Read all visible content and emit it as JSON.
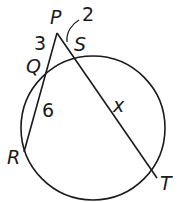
{
  "diagram": {
    "type": "circle-secant-theorem",
    "circle": {
      "cx": 93,
      "cy": 128,
      "r": 72
    },
    "points": {
      "P": {
        "label": "P",
        "x": 57,
        "y": 33
      },
      "Q": {
        "label": "Q",
        "x": 46,
        "y": 71
      },
      "S": {
        "label": "S",
        "x": 72,
        "y": 56
      },
      "R": {
        "label": "R",
        "x": 24,
        "y": 152
      },
      "T": {
        "label": "T",
        "x": 157,
        "y": 178
      }
    },
    "segments": [
      {
        "from": "P",
        "to": "R"
      },
      {
        "from": "P",
        "to": "T"
      }
    ],
    "measures": {
      "PQ": "3",
      "QR": "6",
      "PS": "2",
      "ST": "x"
    },
    "stroke_color": "#1a1a1a"
  }
}
